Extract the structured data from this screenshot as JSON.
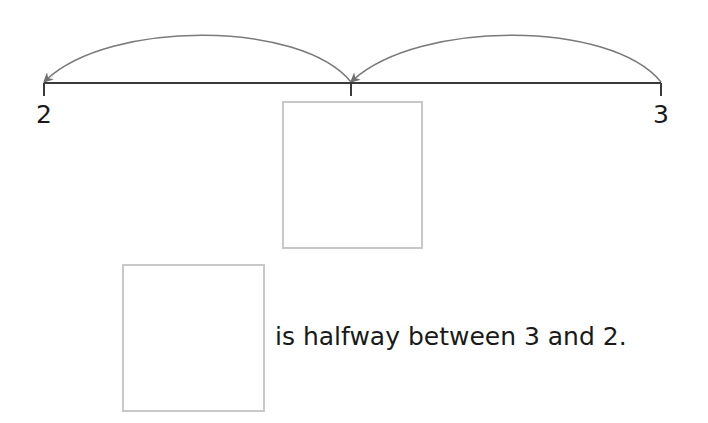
{
  "number_line": {
    "start_label": "2",
    "end_label": "3",
    "midpoint_label": "",
    "arcs": [
      {
        "from": "3",
        "to": "midpoint",
        "direction": "left"
      },
      {
        "from": "midpoint",
        "to": "2",
        "direction": "left"
      }
    ],
    "line_color": "#3a3a3a",
    "arc_color": "#7a7a7a"
  },
  "answer_boxes": [
    {
      "position": "below-midpoint",
      "value": ""
    },
    {
      "position": "sentence-start",
      "value": ""
    }
  ],
  "sentence": {
    "text": "is halfway between 3 and 2."
  }
}
